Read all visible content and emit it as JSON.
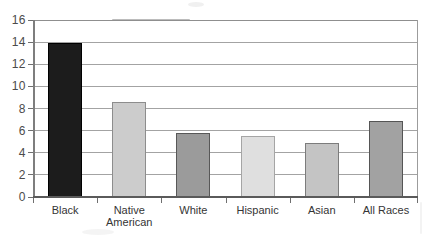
{
  "chart_data": {
    "type": "bar",
    "categories": [
      "Black",
      "Native American",
      "White",
      "Hispanic",
      "Asian",
      "All Races"
    ],
    "values": [
      13.9,
      8.6,
      5.8,
      5.5,
      4.9,
      6.9
    ],
    "bar_colors": [
      "#1c1c1c",
      "#cccccc",
      "#9b9b9b",
      "#dfdfdf",
      "#c4c4c4",
      "#a2a2a2"
    ],
    "bar_border_colors": [
      "#000000",
      "#8d8d8d",
      "#585858",
      "#a5a5a5",
      "#7c7c7c",
      "#555555"
    ],
    "title": "",
    "xlabel": "",
    "ylabel": "",
    "ylim": [
      0,
      16
    ],
    "yticks": [
      0,
      2,
      4,
      6,
      8,
      10,
      12,
      14,
      16
    ],
    "ytick_labels": [
      "0",
      "2",
      "4",
      "6",
      "8",
      "10",
      "12",
      "14",
      "16"
    ],
    "grid": "horizontal",
    "legend": "none",
    "style": {
      "gridline_color": "#a3a3a3",
      "axis_color": "#5a5a5a",
      "tick_label_color": "#4b4b4b",
      "category_label_color": "#353535",
      "background": "#ffffff"
    }
  }
}
